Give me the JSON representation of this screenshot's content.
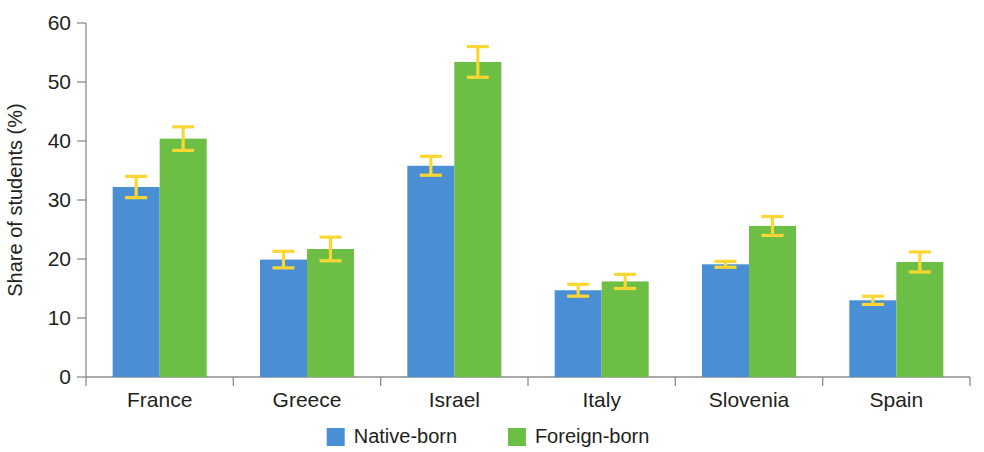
{
  "chart_data": {
    "type": "bar",
    "title": "",
    "xlabel": "",
    "ylabel": "Share of students (%)",
    "ylim": [
      0,
      60
    ],
    "yticks": [
      0,
      10,
      20,
      30,
      40,
      50,
      60
    ],
    "grid": false,
    "legend_position": "bottom",
    "error_bars": "symmetric",
    "categories": [
      "France",
      "Greece",
      "Israel",
      "Italy",
      "Slovenia",
      "Spain"
    ],
    "series": [
      {
        "name": "Native-born",
        "color": "#4a8ed4",
        "values": [
          32.2,
          19.9,
          35.8,
          14.7,
          19.1,
          13.0
        ],
        "errors": [
          1.8,
          1.4,
          1.6,
          1.0,
          0.5,
          0.7
        ]
      },
      {
        "name": "Foreign-born",
        "color": "#6cbe45",
        "values": [
          40.4,
          21.7,
          53.4,
          16.2,
          25.6,
          19.5
        ],
        "errors": [
          2.0,
          2.0,
          2.6,
          1.2,
          1.6,
          1.7
        ]
      }
    ],
    "error_bar_color": "#fcd734",
    "axis_color": "#8c8c8c",
    "text_color": "#231f20"
  },
  "legend": {
    "items": [
      {
        "label": "Native-born",
        "color": "#4a8ed4"
      },
      {
        "label": "Foreign-born",
        "color": "#6cbe45"
      }
    ]
  },
  "axis": {
    "y_title": "Share of students (%)",
    "y_tick_labels": [
      "0",
      "10",
      "20",
      "30",
      "40",
      "50",
      "60"
    ],
    "x_tick_labels": [
      "France",
      "Greece",
      "Israel",
      "Italy",
      "Slovenia",
      "Spain"
    ]
  }
}
